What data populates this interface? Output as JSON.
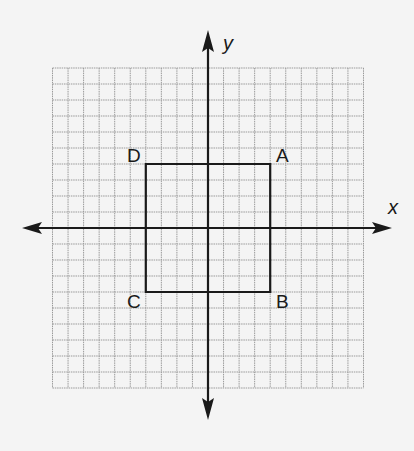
{
  "diagram": {
    "type": "coordinate-plane",
    "grid": {
      "min": -10,
      "max": 10,
      "step": 1,
      "line_color": "#9a9a9a"
    },
    "axes": {
      "x_label": "x",
      "y_label": "y",
      "color": "#1a1a1a"
    },
    "shape": {
      "name": "square ABCD",
      "stroke_color": "#1a1a1a",
      "vertices": [
        {
          "label": "A",
          "x": 4,
          "y": 4
        },
        {
          "label": "B",
          "x": 4,
          "y": -4
        },
        {
          "label": "C",
          "x": -4,
          "y": -4
        },
        {
          "label": "D",
          "x": -4,
          "y": 4
        }
      ]
    }
  }
}
